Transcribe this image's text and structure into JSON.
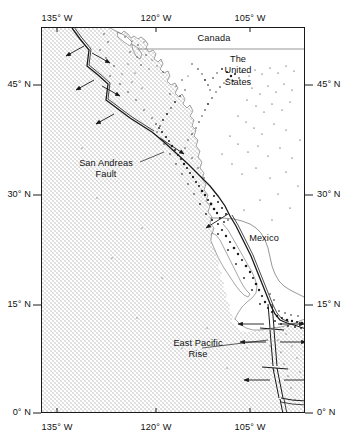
{
  "figure": {
    "kind": "reference-map",
    "projection_note": "equirectangular",
    "frame": {
      "lon_min": -140.0,
      "lon_max": -99.5,
      "lat_min": -1.0,
      "lat_max": 53.0
    },
    "background_color": "#ffffff",
    "ocean_fill_color": "#d9d9d9",
    "line_color": "#1a1a1a",
    "coast_color": "#555555",
    "epicenter_color": "#1a1a1a"
  },
  "axes": {
    "longitude": {
      "unit_suffix": "W",
      "ticks": [
        {
          "label": "135° W",
          "value": -135
        },
        {
          "label": "120° W",
          "value": -120
        },
        {
          "label": "105° W",
          "value": -105
        }
      ]
    },
    "latitude": {
      "unit_suffix": "N",
      "ticks": [
        {
          "label": "45° N",
          "value": 45
        },
        {
          "label": "30° N",
          "value": 30
        },
        {
          "label": "15° N",
          "value": 15
        },
        {
          "label": "0° N",
          "value": 0
        }
      ]
    }
  },
  "labels": {
    "canada": "Canada",
    "united_states_line1": "The",
    "united_states_line2": "United",
    "united_states_line3": "States",
    "mexico": "Mexico",
    "san_andreas_line1": "San Andreas",
    "san_andreas_line2": "Fault",
    "east_pacific_rise_line1": "East Pacific",
    "east_pacific_rise_line2": "Rise"
  },
  "map_features": {
    "plate_boundaries": [
      "Juan de Fuca Ridge with transform offsets",
      "San Andreas transform fault",
      "Gulf of California transform system",
      "East Pacific Rise with transform offsets",
      "Rivera / Galapagos triple junction"
    ],
    "spreading_arrows": "divergence arrows drawn perpendicular to ridge segments",
    "seismicity": "earthquake epicenters plotted as small black dots"
  }
}
